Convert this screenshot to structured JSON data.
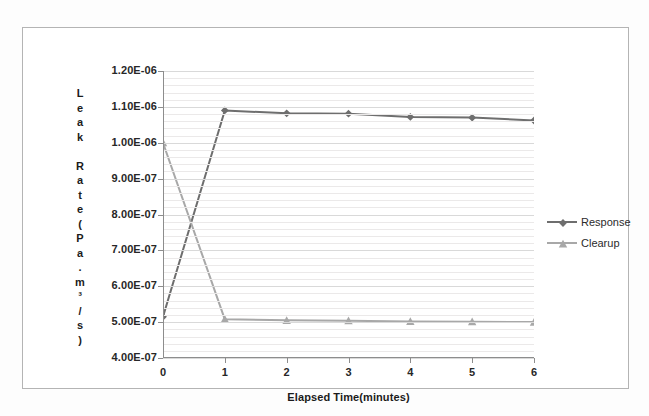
{
  "chart_data": {
    "type": "line",
    "title": "",
    "xlabel": "Elapsed Time(minutes)",
    "ylabel": "Leak Rate(Pa.m³/s)",
    "ylabel_chars": [
      "L",
      "e",
      "a",
      "k",
      "",
      "R",
      "a",
      "t",
      "e",
      "(",
      "P",
      "a",
      ".",
      "m",
      "³",
      "/",
      "s",
      ")"
    ],
    "x": [
      0,
      1,
      2,
      3,
      4,
      5,
      6
    ],
    "xticklabels": [
      "0",
      "1",
      "2",
      "3",
      "4",
      "5",
      "6"
    ],
    "xlim": [
      0,
      6
    ],
    "ylim": [
      4e-07,
      1.2e-06
    ],
    "yticklabels": [
      "1.20E-06",
      "1.10E-06",
      "1.00E-06",
      "9.00E-07",
      "8.00E-07",
      "7.00E-07",
      "6.00E-07",
      "5.00E-07",
      "4.00E-07"
    ],
    "ytickvalues": [
      1.2e-06,
      1.1e-06,
      1e-06,
      9e-07,
      8e-07,
      7e-07,
      6e-07,
      5e-07,
      4e-07
    ],
    "grid": "horizontal-major-and-minor",
    "legend_position": "right",
    "series": [
      {
        "name": "Response",
        "color": "#6e6e6e",
        "marker": "diamond",
        "values": [
          5.15e-07,
          1.09e-06,
          1.082e-06,
          1.081e-06,
          1.072e-06,
          1.07e-06,
          1.062e-06
        ]
      },
      {
        "name": "Clearup",
        "color": "#a8a8a8",
        "marker": "triangle",
        "values": [
          1e-06,
          5.08e-07,
          5.05e-07,
          5.04e-07,
          5.02e-07,
          5.01e-07,
          5e-07
        ]
      }
    ]
  },
  "legend": {
    "items": [
      {
        "label": "Response"
      },
      {
        "label": "Clearup"
      }
    ]
  },
  "colors": {
    "response": "#6e6e6e",
    "clearup": "#a8a8a8",
    "axis": "#8d8d8d",
    "grid_major": "#d9d9d9",
    "grid_minor": "#ebe9e9",
    "text": "#272727",
    "frame": "#b4b4b4"
  }
}
